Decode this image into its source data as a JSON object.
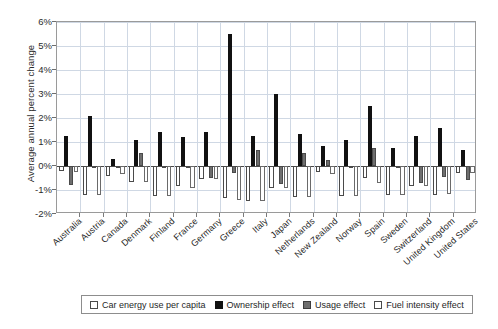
{
  "chart_data": {
    "type": "bar",
    "title": "",
    "xlabel": "",
    "ylabel": "Average annual percent change",
    "ylim": [
      -2,
      6
    ],
    "ytick_values": [
      -2,
      -1,
      0,
      1,
      2,
      3,
      4,
      5,
      6
    ],
    "ytick_labels": [
      "-2%",
      "-1%",
      "0%",
      "1%",
      "2%",
      "3%",
      "4%",
      "5%",
      "6%"
    ],
    "grid": true,
    "legend_position": "bottom",
    "categories": [
      "Australia",
      "Austria",
      "Canada",
      "Denmark",
      "Finland",
      "France",
      "Germany",
      "Greece",
      "Italy",
      "Japan",
      "Netherlands",
      "New Zealand",
      "Norway",
      "Spain",
      "Sweden",
      "Switzerland",
      "United Kingdom",
      "United States"
    ],
    "series": [
      {
        "name": "Car energy use per capita",
        "style": "open",
        "values": [
          -0.2,
          -1.2,
          -0.4,
          -0.65,
          -1.25,
          -0.85,
          -0.55,
          -1.35,
          -1.45,
          -0.9,
          -1.3,
          -0.25,
          -1.25,
          -0.5,
          -1.2,
          -0.85,
          -1.2,
          -0.3
        ]
      },
      {
        "name": "Ownership effect",
        "style": "solid-black",
        "values": [
          1.25,
          2.1,
          0.3,
          1.1,
          1.4,
          1.2,
          1.4,
          5.5,
          1.25,
          3.0,
          1.35,
          0.85,
          1.1,
          2.5,
          0.75,
          1.25,
          1.6,
          0.65
        ]
      },
      {
        "name": "Usage effect",
        "style": "grey",
        "values": [
          -0.8,
          -0.05,
          -0.05,
          0.55,
          -0.05,
          -0.05,
          -0.5,
          -0.3,
          0.65,
          -0.75,
          0.55,
          0.25,
          -0.05,
          0.75,
          -0.05,
          -0.7,
          -0.45,
          -0.6
        ]
      },
      {
        "name": "Fuel intensity effect",
        "style": "open",
        "values": [
          -0.25,
          -1.2,
          -0.35,
          -0.65,
          -1.25,
          -0.9,
          -0.55,
          -1.4,
          -1.45,
          -0.9,
          -1.3,
          -0.35,
          -1.25,
          -0.7,
          -1.2,
          -0.85,
          -1.15,
          -0.3
        ]
      }
    ]
  },
  "legend": {
    "items": [
      {
        "label": "Car energy use per capita",
        "swatch": "total"
      },
      {
        "label": "Ownership effect",
        "swatch": "own"
      },
      {
        "label": "Usage effect",
        "swatch": "usage"
      },
      {
        "label": "Fuel intensity effect",
        "swatch": "fuel"
      }
    ]
  }
}
